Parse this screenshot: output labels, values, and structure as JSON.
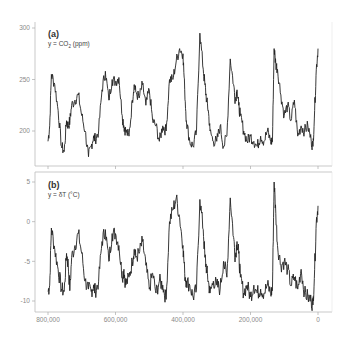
{
  "chart_data": [
    {
      "type": "line",
      "panel_label": "(a)",
      "ylabel": "y = CO₂ (ppm)",
      "y_ticks": [
        "300",
        "250",
        "200"
      ],
      "ylim": [
        165,
        300
      ],
      "xlabel": "",
      "x_ticks": [
        "800,000",
        "600,000",
        "400,000",
        "200,000",
        "0"
      ],
      "xlim": [
        800000,
        0
      ],
      "grid": false,
      "series": [
        {
          "name": "CO2",
          "x": [
            800000,
            795000,
            790000,
            780000,
            770000,
            760000,
            752000,
            745000,
            740000,
            735000,
            730000,
            720000,
            710000,
            700000,
            690000,
            680000,
            672000,
            665000,
            660000,
            650000,
            640000,
            630000,
            620000,
            610000,
            600000,
            590000,
            580000,
            575000,
            570000,
            560000,
            550000,
            545000,
            540000,
            530000,
            520000,
            510000,
            500000,
            490000,
            480000,
            470000,
            460000,
            450000,
            440000,
            430000,
            420000,
            410000,
            400000,
            395000,
            390000,
            380000,
            370000,
            360000,
            350000,
            340000,
            335000,
            330000,
            325000,
            320000,
            310000,
            300000,
            290000,
            280000,
            270000,
            260000,
            250000,
            245000,
            240000,
            235000,
            230000,
            220000,
            210000,
            200000,
            190000,
            180000,
            170000,
            160000,
            150000,
            140000,
            135000,
            130000,
            125000,
            120000,
            110000,
            100000,
            90000,
            80000,
            70000,
            60000,
            50000,
            40000,
            30000,
            20000,
            15000,
            10000,
            5000,
            0
          ],
          "values": [
            190,
            205,
            255,
            245,
            220,
            185,
            180,
            210,
            205,
            210,
            225,
            230,
            235,
            215,
            200,
            175,
            185,
            195,
            192,
            200,
            240,
            258,
            230,
            250,
            248,
            252,
            215,
            205,
            200,
            195,
            230,
            245,
            238,
            232,
            245,
            225,
            240,
            210,
            205,
            190,
            205,
            200,
            250,
            250,
            268,
            280,
            275,
            240,
            210,
            190,
            185,
            200,
            295,
            260,
            245,
            230,
            220,
            200,
            190,
            190,
            205,
            185,
            195,
            270,
            245,
            230,
            240,
            225,
            215,
            200,
            190,
            195,
            190,
            185,
            195,
            190,
            200,
            190,
            190,
            280,
            265,
            260,
            235,
            215,
            225,
            210,
            230,
            195,
            205,
            200,
            205,
            190,
            185,
            220,
            260,
            280
          ]
        }
      ]
    },
    {
      "type": "line",
      "panel_label": "(b)",
      "ylabel": "y = δT (°C)",
      "y_ticks": [
        "5",
        "0",
        "-5",
        "-10"
      ],
      "ylim": [
        -11,
        6
      ],
      "xlabel": "",
      "x_ticks": [
        "800,000",
        "600,000",
        "400,000",
        "200,000",
        "0"
      ],
      "xlim": [
        800000,
        0
      ],
      "grid": false,
      "series": [
        {
          "name": "deltaT",
          "x": [
            800000,
            795000,
            790000,
            780000,
            770000,
            760000,
            752000,
            745000,
            740000,
            735000,
            730000,
            720000,
            710000,
            700000,
            690000,
            680000,
            672000,
            665000,
            660000,
            650000,
            640000,
            630000,
            620000,
            610000,
            600000,
            590000,
            580000,
            575000,
            570000,
            560000,
            550000,
            545000,
            540000,
            530000,
            520000,
            510000,
            500000,
            490000,
            480000,
            470000,
            460000,
            450000,
            440000,
            430000,
            420000,
            410000,
            400000,
            395000,
            390000,
            380000,
            370000,
            360000,
            350000,
            340000,
            335000,
            330000,
            325000,
            320000,
            310000,
            300000,
            290000,
            280000,
            270000,
            260000,
            250000,
            245000,
            240000,
            235000,
            230000,
            220000,
            210000,
            200000,
            190000,
            180000,
            170000,
            160000,
            150000,
            140000,
            135000,
            130000,
            125000,
            120000,
            110000,
            100000,
            90000,
            80000,
            70000,
            60000,
            50000,
            40000,
            30000,
            20000,
            15000,
            10000,
            5000,
            0
          ],
          "values": [
            -8.8,
            -8,
            -0.8,
            -3.5,
            -6,
            -8.5,
            -8.8,
            -4,
            -5.5,
            -8.7,
            -4.5,
            -3,
            -1.5,
            -4,
            -7.5,
            -8.5,
            -8.8,
            -8,
            -8.8,
            -7.5,
            -2.5,
            -1,
            -5,
            -1.5,
            -1.5,
            -3,
            -7,
            -6,
            -8,
            -7,
            -5,
            -3.5,
            -4.5,
            -4,
            -2.5,
            -5.5,
            -8.5,
            -6.5,
            -9,
            -7.5,
            -8,
            -9.8,
            0,
            1.5,
            3,
            0.5,
            -3,
            -6.5,
            -7.5,
            -8,
            -9.5,
            -8.5,
            2.8,
            -1,
            -4.5,
            -6,
            -7.5,
            -9,
            -7.5,
            -8,
            -8.5,
            -5,
            -7,
            3,
            -2,
            -4.5,
            -2.5,
            -4,
            -7,
            -9,
            -8,
            -9.5,
            -8,
            -9,
            -8.5,
            -9,
            -8,
            -9,
            -8.5,
            5,
            1,
            -3,
            -5.5,
            -5,
            -6,
            -8,
            -7,
            -8.5,
            -6,
            -9,
            -9.5,
            -10,
            -10.5,
            -6,
            0,
            2
          ]
        }
      ]
    }
  ],
  "panels": {
    "a": {
      "label": "(a)",
      "ylabel_pre": "y = CO",
      "ylabel_sub": "2",
      "ylabel_post": " (ppm)"
    },
    "b": {
      "label": "(b)",
      "ylabel": "y = δT (°C)"
    }
  },
  "x_axis": {
    "ticks": [
      "800,000",
      "600,000",
      "400,000",
      "200,000",
      "0"
    ]
  }
}
